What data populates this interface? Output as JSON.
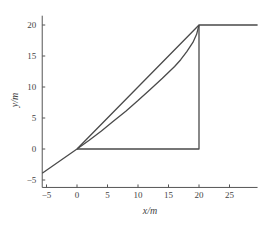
{
  "chart_data": {
    "type": "line",
    "title": "",
    "xlabel": "x/m",
    "ylabel": "y/m",
    "xlim": [
      -5.7,
      29.6
    ],
    "ylim": [
      -6.2,
      21.5
    ],
    "xticks": [
      -5,
      0,
      5,
      10,
      15,
      20,
      25
    ],
    "yticks": [
      -5,
      0,
      5,
      10,
      15,
      20
    ],
    "grid": false,
    "legend": null,
    "series": [
      {
        "name": "approach-and-exit-path",
        "style": "solid",
        "points": [
          [
            -5.7,
            -3.9
          ],
          [
            0,
            0
          ],
          [
            20,
            20
          ],
          [
            29.6,
            20
          ]
        ]
      },
      {
        "name": "curved-path",
        "style": "solid",
        "points": [
          [
            0,
            0
          ],
          [
            2,
            1.4
          ],
          [
            4,
            2.9
          ],
          [
            6,
            4.5
          ],
          [
            8,
            6.1
          ],
          [
            10,
            7.8
          ],
          [
            12,
            9.6
          ],
          [
            14,
            11.4
          ],
          [
            16,
            13.3
          ],
          [
            17,
            14.4
          ],
          [
            18,
            15.7
          ],
          [
            19,
            17.2
          ],
          [
            19.6,
            18.5
          ],
          [
            20,
            20
          ]
        ]
      },
      {
        "name": "right-angle-path",
        "style": "solid",
        "points": [
          [
            0,
            0
          ],
          [
            20,
            0
          ],
          [
            20,
            20
          ]
        ]
      }
    ]
  }
}
